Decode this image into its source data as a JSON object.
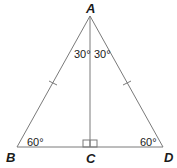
{
  "figure": {
    "type": "isosceles triangle with altitude",
    "vertices": {
      "A": {
        "label": "A",
        "x": 90,
        "y": 16
      },
      "B": {
        "label": "B",
        "x": 17,
        "y": 147
      },
      "C": {
        "label": "C",
        "x": 90,
        "y": 147
      },
      "D": {
        "label": "D",
        "x": 163,
        "y": 147
      }
    },
    "angles": {
      "BAC": "30°",
      "CAD": "30°",
      "ABC": "60°",
      "ADC": "60°"
    },
    "marks": {
      "right_angle_at": "C",
      "congruent_sides": [
        "AB",
        "AD"
      ]
    },
    "colors": {
      "line": "#7a7a7a",
      "text": "#1a1a1a"
    }
  }
}
